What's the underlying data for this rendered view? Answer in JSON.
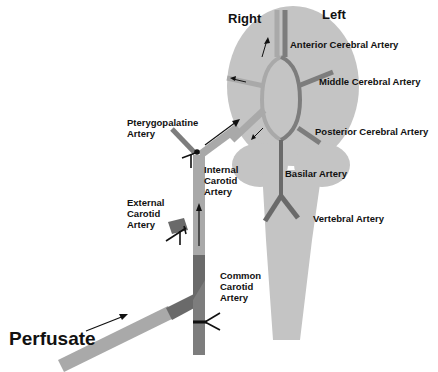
{
  "sides": {
    "right": "Right",
    "left": "Left"
  },
  "labels": {
    "anterior_cerebral": "Anterior Cerebral Artery",
    "middle_cerebral": "Middle Cerebral Artery",
    "posterior_cerebral": "Posterior Cerebral Artery",
    "basilar": "Basilar Artery",
    "vertebral": "Vertebral Artery",
    "pterygopalatine": "Pterygopalatine\nArtery",
    "internal_carotid": "Internal\nCarotid\nArtery",
    "external_carotid": "External\nCarotid\nArtery",
    "common_carotid": "Common\nCarotid\nArtery",
    "perfusate": "Perfusate"
  },
  "colors": {
    "brain": "#c4c4c4",
    "vessel_light": "#a9a9a9",
    "vessel_dark": "#7d7d7d",
    "vessel_darker": "#6a6a6a",
    "ink": "#111111"
  }
}
